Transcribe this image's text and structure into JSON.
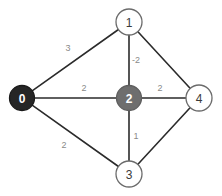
{
  "figure": {
    "width": 222,
    "height": 196,
    "background": "#ffffff",
    "type": "weighted-undirected-graph"
  },
  "chart_data": {
    "type": "diagram",
    "title": "",
    "xlabel": "",
    "ylabel": "",
    "graph_kind": "weighted undirected graph",
    "nodes": [
      {
        "id": "0",
        "label": "0",
        "x": 22,
        "y": 98,
        "r": 12.5,
        "fill": "#262626",
        "stroke": "#1a1a1a",
        "text_color": "#ffffff",
        "style": "filled-dark"
      },
      {
        "id": "1",
        "label": "1",
        "x": 129,
        "y": 22,
        "r": 13,
        "fill": "#ffffff",
        "stroke": "#6b6b6b",
        "text_color": "#3a3a3a",
        "style": "open"
      },
      {
        "id": "2",
        "label": "2",
        "x": 129,
        "y": 98,
        "r": 12.5,
        "fill": "#6e6e6e",
        "stroke": "#5e5e5e",
        "text_color": "#ffffff",
        "style": "filled-gray"
      },
      {
        "id": "3",
        "label": "3",
        "x": 129,
        "y": 174,
        "r": 13,
        "fill": "#ffffff",
        "stroke": "#6b6b6b",
        "text_color": "#3a3a3a",
        "style": "open"
      },
      {
        "id": "4",
        "label": "4",
        "x": 199,
        "y": 98,
        "r": 13,
        "fill": "#ffffff",
        "stroke": "#6b6b6b",
        "text_color": "#3a3a3a",
        "style": "open"
      }
    ],
    "edges": [
      {
        "source": "0",
        "target": "1",
        "weight": "3",
        "label_x": 68,
        "label_y": 48
      },
      {
        "source": "0",
        "target": "2",
        "weight": "2",
        "label_x": 84,
        "label_y": 88
      },
      {
        "source": "0",
        "target": "3",
        "weight": "2",
        "label_x": 64,
        "label_y": 145
      },
      {
        "source": "1",
        "target": "2",
        "weight": "-2",
        "label_x": 136,
        "label_y": 60
      },
      {
        "source": "1",
        "target": "4",
        "weight": "",
        "label_x": 170,
        "label_y": 56
      },
      {
        "source": "2",
        "target": "4",
        "weight": "2",
        "label_x": 160,
        "label_y": 88
      },
      {
        "source": "2",
        "target": "3",
        "weight": "1",
        "label_x": 136,
        "label_y": 136
      },
      {
        "source": "3",
        "target": "4",
        "weight": "",
        "label_x": 170,
        "label_y": 140
      }
    ],
    "edge_color": "#2b2b2b",
    "weight_label_color": "#8a8a8a",
    "legend": [],
    "annotations": []
  }
}
